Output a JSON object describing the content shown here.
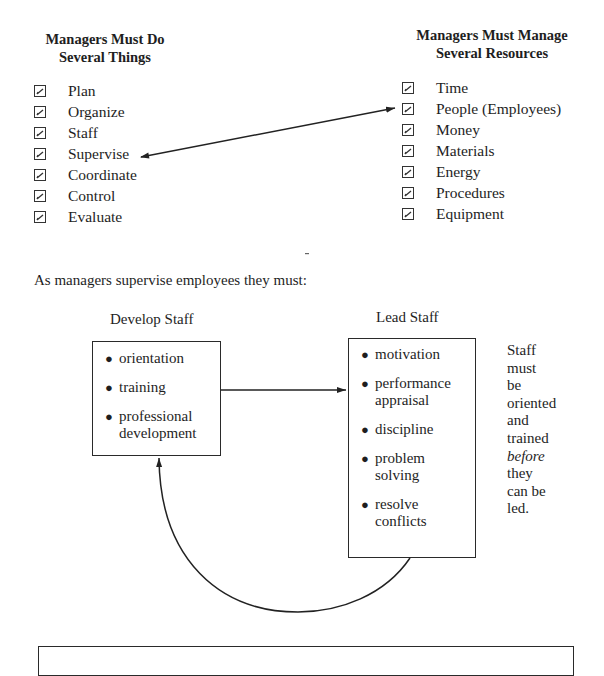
{
  "left_column": {
    "heading_line1": "Managers Must Do",
    "heading_line2": "Several Things",
    "items": [
      "Plan",
      "Organize",
      "Staff",
      "Supervise",
      "Coordinate",
      "Control",
      "Evaluate"
    ]
  },
  "right_column": {
    "heading_line1": "Managers Must Manage",
    "heading_line2": "Several Resources",
    "items": [
      "Time",
      "People (Employees)",
      "Money",
      "Materials",
      "Energy",
      "Procedures",
      "Equipment"
    ]
  },
  "connector": {
    "from": "Supervise",
    "to": "People (Employees)",
    "type": "double-arrow"
  },
  "intro_text": "As managers supervise employees they must:",
  "develop": {
    "title": "Develop Staff",
    "items": [
      "orientation",
      "training",
      "professional development"
    ]
  },
  "lead": {
    "title": "Lead Staff",
    "items": [
      "motivation",
      "performance appraisal",
      "discipline",
      "problem solving",
      "resolve conflicts"
    ]
  },
  "side_note": {
    "lines": [
      "Staff",
      "must",
      "be",
      "oriented",
      "and",
      "trained"
    ],
    "emphasis": "before",
    "tail_lines": [
      "they",
      "can be",
      "led."
    ]
  },
  "flow": {
    "develop_to_lead": "arrow",
    "lead_to_develop": "curved-arrow"
  }
}
